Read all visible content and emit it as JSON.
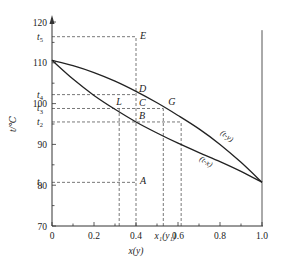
{
  "chart_data": {
    "type": "line",
    "title": "",
    "xlabel": "x(y)",
    "ylabel": "t/℃",
    "xlim": [
      0,
      1.0
    ],
    "ylim": [
      70,
      120
    ],
    "grid": false,
    "x_ticks": [
      {
        "value": 0,
        "label": "0"
      },
      {
        "value": 0.2,
        "label": "0.2"
      },
      {
        "value": 0.4,
        "label": "0.4"
      },
      {
        "value": 0.6,
        "label": "0.6"
      },
      {
        "value": 0.8,
        "label": "0.8"
      },
      {
        "value": 1.0,
        "label": "1.0"
      }
    ],
    "x_extra_label": {
      "value": 0.53,
      "label": "x₁(y₁)"
    },
    "y_ticks": [
      {
        "value": 70,
        "label": "70"
      },
      {
        "value": 80,
        "label": "80"
      },
      {
        "value": 90,
        "label": "90"
      },
      {
        "value": 100,
        "label": "100"
      },
      {
        "value": 110,
        "label": "110"
      },
      {
        "value": 120,
        "label": "120"
      }
    ],
    "y_special_ticks": [
      {
        "name": "t5",
        "value": 116.4
      },
      {
        "name": "t4",
        "value": 102.2
      },
      {
        "name": "t3",
        "value": 98.8
      },
      {
        "name": "t2",
        "value": 95.5
      },
      {
        "name": "t1",
        "value": 80.7
      }
    ],
    "series": [
      {
        "name": "(t-y)",
        "label": "(t-y)",
        "description": "dew point (vapor) curve",
        "x": [
          0,
          0.1,
          0.2,
          0.3,
          0.4,
          0.5,
          0.6,
          0.7,
          0.8,
          0.9,
          1.0
        ],
        "y": [
          110.6,
          109.3,
          107.6,
          105.5,
          103.0,
          100.2,
          97.1,
          93.8,
          90.0,
          85.6,
          80.7
        ]
      },
      {
        "name": "(t-x)",
        "label": "(t-x)",
        "description": "bubble point (liquid) curve",
        "x": [
          0,
          0.1,
          0.2,
          0.3,
          0.4,
          0.5,
          0.6,
          0.7,
          0.8,
          0.9,
          1.0
        ],
        "y": [
          110.6,
          106.0,
          102.0,
          98.6,
          95.5,
          92.8,
          90.3,
          88.0,
          85.8,
          83.4,
          80.7
        ]
      }
    ],
    "points": [
      {
        "label": "E",
        "x": 0.4,
        "y": 116.4
      },
      {
        "label": "D",
        "x": 0.4,
        "y": 102.2
      },
      {
        "label": "C",
        "x": 0.4,
        "y": 98.8
      },
      {
        "label": "B",
        "x": 0.4,
        "y": 95.5
      },
      {
        "label": "A",
        "x": 0.4,
        "y": 80.7
      },
      {
        "label": "L",
        "x": 0.32,
        "y": 98.8
      },
      {
        "label": "G",
        "x": 0.53,
        "y": 98.8
      }
    ],
    "dashed_guides": {
      "horizontal": [
        {
          "y": 116.4,
          "x_to": 0.4
        },
        {
          "y": 102.2,
          "x_to": 0.4
        },
        {
          "y": 98.8,
          "x_to": 0.53
        },
        {
          "y": 95.5,
          "x_to": 0.615
        },
        {
          "y": 80.7,
          "x_to": 0.4
        }
      ],
      "vertical": [
        {
          "x": 0.32,
          "y_from": 70,
          "y_to": 98.8
        },
        {
          "x": 0.4,
          "y_from": 70,
          "y_to": 116.4
        },
        {
          "x": 0.53,
          "y_from": 70,
          "y_to": 98.8
        },
        {
          "x": 0.615,
          "y_from": 70,
          "y_to": 95.5
        }
      ]
    },
    "right_border_line": {
      "x": 1.0,
      "y_from": 70,
      "y_to": 118
    }
  },
  "labels": {
    "y_axis_title": "t/℃",
    "x_axis_title": "x(y)",
    "x_extra": "x₁(y₁)",
    "t5": "t",
    "t5_sub": "5",
    "t4": "t",
    "t4_sub": "4",
    "t3": "t",
    "t3_sub": "3",
    "t2": "t",
    "t2_sub": "2",
    "t1": "t",
    "t1_sub": "1",
    "curve_ty": "(t-y)",
    "curve_tx": "(t-x)"
  }
}
